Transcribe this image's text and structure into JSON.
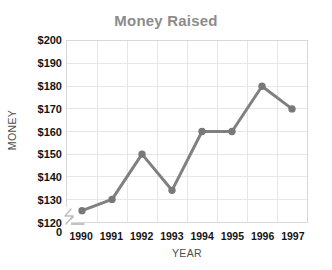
{
  "chart_data": {
    "type": "line",
    "title": "Money Raised",
    "xlabel": "YEAR",
    "ylabel": "MONEY",
    "categories": [
      "1990",
      "1991",
      "1992",
      "1993",
      "1994",
      "1995",
      "1996",
      "1997"
    ],
    "values": [
      125,
      130,
      150,
      134,
      160,
      160,
      180,
      170
    ],
    "series": [
      {
        "name": "Money Raised",
        "values": [
          125,
          130,
          150,
          134,
          160,
          160,
          180,
          170
        ]
      }
    ],
    "ylim": [
      120,
      200
    ],
    "ytick_step": 10,
    "ytick_labels": [
      "$200",
      "$190",
      "$180",
      "$170",
      "$160",
      "$150",
      "$140",
      "$130",
      "$120",
      "0"
    ],
    "ytick_values": [
      200,
      190,
      180,
      170,
      160,
      150,
      140,
      130,
      120,
      0
    ],
    "xtick_labels": [
      "1990",
      "1991",
      "1992",
      "1993",
      "1994",
      "1995",
      "1996",
      "1997"
    ],
    "grid": true,
    "legend": "none",
    "axis_break": true,
    "axis_break_note": "zigzag break between 0 and $120 on the value axis",
    "colors": {
      "line": "#808080",
      "marker": "#787878",
      "grid": "#e6e6e6",
      "frame": "#d8d8d8",
      "title": "#8c8c8c",
      "tick_text": "#141414",
      "axis_title": "#4d4d4d",
      "background": "#ffffff"
    },
    "marker": "circle",
    "marker_size": 5,
    "line_width": 3
  }
}
